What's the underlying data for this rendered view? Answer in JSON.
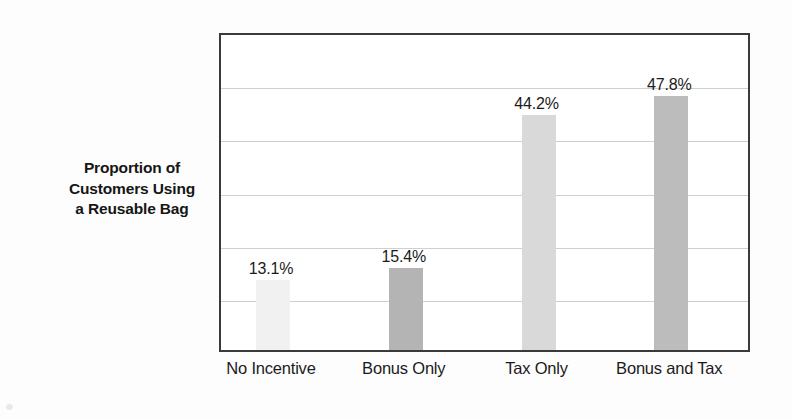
{
  "figure": {
    "y_axis_title_lines": [
      "Proportion of",
      "Customers Using",
      "a Reusable Bag"
    ],
    "frame_color": "#3a3a3a",
    "gridline_color": "#cfcfcf",
    "background_color": "#fdfdfd"
  },
  "chart_data": {
    "type": "bar",
    "title": "",
    "subtitle": "",
    "xlabel": "",
    "ylabel": "Proportion of Customers Using a Reusable Bag",
    "categories": [
      "No Incentive",
      "Bonus Only",
      "Tax Only",
      "Bonus and Tax"
    ],
    "values": [
      13.1,
      15.4,
      44.2,
      47.8
    ],
    "value_labels": [
      "13.1%",
      "15.4%",
      "44.2%",
      "47.8%"
    ],
    "unit": "%",
    "ylim": [
      0,
      60
    ],
    "y_tick_values": [
      0,
      10,
      20,
      30,
      40,
      50,
      60
    ],
    "y_tick_labels_shown": false,
    "grid": true,
    "grid_axis": "y",
    "legend": false,
    "legend_position": "none",
    "bar_colors": [
      "#f1f1f1",
      "#b4b4b4",
      "#d9d9d9",
      "#bcbcbc"
    ],
    "bars": [
      {
        "category": "No Incentive",
        "value": 13.1,
        "label": "13.1%",
        "color": "#f1f1f1"
      },
      {
        "category": "Bonus Only",
        "value": 15.4,
        "label": "15.4%",
        "color": "#b4b4b4"
      },
      {
        "category": "Tax Only",
        "value": 44.2,
        "label": "44.2%",
        "color": "#d9d9d9"
      },
      {
        "category": "Bonus and Tax",
        "value": 47.8,
        "label": "47.8%",
        "color": "#bcbcbc"
      }
    ]
  }
}
